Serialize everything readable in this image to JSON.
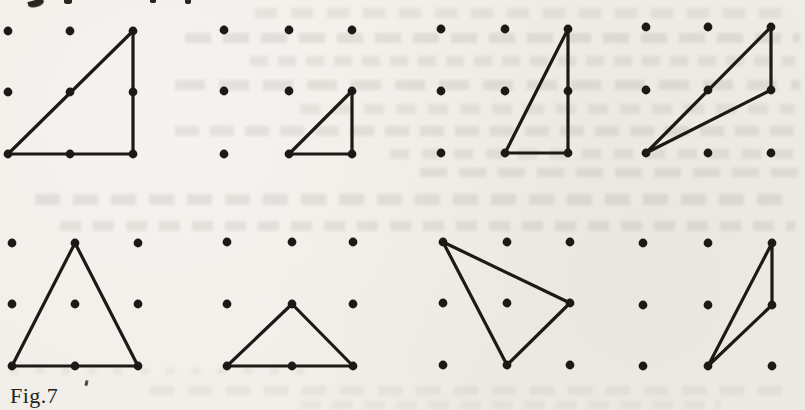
{
  "figure": {
    "caption": "Fig.7",
    "paper_color": "#f0ede7",
    "ink_color": "#1d1a16",
    "dot_radius": 4.4,
    "line_width": 3.2,
    "grid_note": "each panel is a 3x3 lattice of dots; triangle vertices given as [col,row], row 0 = top",
    "panels": [
      {
        "name": "top-1",
        "cols": [
          8,
          70,
          133
        ],
        "rows": [
          31,
          92,
          154
        ],
        "triangle": [
          [
            0,
            2
          ],
          [
            2,
            0
          ],
          [
            2,
            2
          ]
        ]
      },
      {
        "name": "top-2",
        "cols": [
          224,
          289,
          352
        ],
        "rows": [
          30,
          91,
          154
        ],
        "triangle": [
          [
            1,
            2
          ],
          [
            2,
            1
          ],
          [
            2,
            2
          ]
        ]
      },
      {
        "name": "top-3",
        "cols": [
          441,
          505,
          568
        ],
        "rows": [
          29,
          91,
          153
        ],
        "triangle": [
          [
            1,
            2
          ],
          [
            2,
            0
          ],
          [
            2,
            2
          ]
        ]
      },
      {
        "name": "top-4",
        "cols": [
          646,
          708,
          771
        ],
        "rows": [
          27,
          90,
          153
        ],
        "triangle": [
          [
            0,
            2
          ],
          [
            2,
            0
          ],
          [
            2,
            1
          ]
        ]
      },
      {
        "name": "bottom-1",
        "cols": [
          12,
          75,
          138
        ],
        "rows": [
          243,
          304,
          366
        ],
        "triangle": [
          [
            0,
            2
          ],
          [
            1,
            0
          ],
          [
            2,
            2
          ]
        ]
      },
      {
        "name": "bottom-2",
        "cols": [
          227,
          292,
          353
        ],
        "rows": [
          242,
          304,
          366
        ],
        "triangle": [
          [
            0,
            2
          ],
          [
            1,
            1
          ],
          [
            2,
            2
          ]
        ]
      },
      {
        "name": "bottom-3",
        "cols": [
          443,
          507,
          570
        ],
        "rows": [
          242,
          303,
          365
        ],
        "triangle": [
          [
            0,
            0
          ],
          [
            2,
            1
          ],
          [
            1,
            2
          ]
        ]
      },
      {
        "name": "bottom-4",
        "cols": [
          643,
          708,
          772
        ],
        "rows": [
          243,
          305,
          366
        ],
        "triangle": [
          [
            1,
            2
          ],
          [
            2,
            0
          ],
          [
            2,
            1
          ]
        ]
      }
    ]
  },
  "artifacts": {
    "bleed_color": "#6e6a60",
    "stripes": [
      {
        "x": 255,
        "y": 8,
        "w": 540,
        "h": 10,
        "opacity": 0.1,
        "dash": 22,
        "gap": 14
      },
      {
        "x": 185,
        "y": 33,
        "w": 615,
        "h": 10,
        "opacity": 0.13,
        "dash": 26,
        "gap": 12
      },
      {
        "x": 250,
        "y": 56,
        "w": 545,
        "h": 10,
        "opacity": 0.11,
        "dash": 18,
        "gap": 10
      },
      {
        "x": 175,
        "y": 80,
        "w": 625,
        "h": 10,
        "opacity": 0.13,
        "dash": 30,
        "gap": 14
      },
      {
        "x": 300,
        "y": 104,
        "w": 495,
        "h": 10,
        "opacity": 0.1,
        "dash": 20,
        "gap": 12
      },
      {
        "x": 175,
        "y": 126,
        "w": 625,
        "h": 10,
        "opacity": 0.12,
        "dash": 24,
        "gap": 11
      },
      {
        "x": 390,
        "y": 149,
        "w": 410,
        "h": 10,
        "opacity": 0.11,
        "dash": 19,
        "gap": 13
      },
      {
        "x": 420,
        "y": 168,
        "w": 380,
        "h": 9,
        "opacity": 0.12,
        "dash": 27,
        "gap": 12
      },
      {
        "x": 35,
        "y": 194,
        "w": 760,
        "h": 11,
        "opacity": 0.13,
        "dash": 25,
        "gap": 13
      },
      {
        "x": 60,
        "y": 221,
        "w": 735,
        "h": 10,
        "opacity": 0.12,
        "dash": 21,
        "gap": 12
      },
      {
        "x": 10,
        "y": 368,
        "w": 300,
        "h": 6,
        "opacity": 0.08,
        "dash": 8,
        "gap": 18
      },
      {
        "x": 150,
        "y": 386,
        "w": 640,
        "h": 9,
        "opacity": 0.08,
        "dash": 24,
        "gap": 14
      },
      {
        "x": 300,
        "y": 401,
        "w": 420,
        "h": 8,
        "opacity": 0.07,
        "dash": 20,
        "gap": 12
      }
    ],
    "edge_blobs": [
      {
        "x": 28,
        "y": 0,
        "w": 16,
        "h": 7,
        "rotate": -15,
        "radius": "0 0 60% 60%"
      },
      {
        "x": 64,
        "y": 0,
        "w": 8,
        "h": 4,
        "rotate": 0,
        "radius": "0 0 50% 50%"
      },
      {
        "x": 150,
        "y": 0,
        "w": 6,
        "h": 3,
        "rotate": 0,
        "radius": "0 0 50% 50%"
      },
      {
        "x": 185,
        "y": 0,
        "w": 6,
        "h": 4,
        "rotate": 0,
        "radius": "0 0 50% 50%"
      }
    ]
  }
}
